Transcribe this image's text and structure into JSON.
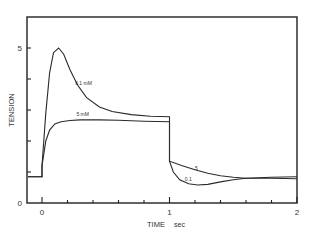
{
  "chart_data": {
    "type": "line",
    "title": "",
    "xlabel": "TIME",
    "xunit": "sec",
    "ylabel": "TENSION",
    "xlim": [
      -0.2,
      2.0
    ],
    "ylim": [
      0,
      6
    ],
    "x_ticks": [
      0,
      1,
      2
    ],
    "x_minor_step": 0.2,
    "y_ticks": [
      0,
      5
    ],
    "y_minor_step": 1,
    "grid": false,
    "legend": "inline labels",
    "annotations": [
      {
        "text": "0.1 mM",
        "x": 0.26,
        "y": 3.8
      },
      {
        "text": "5 mM",
        "x": 0.27,
        "y": 2.8
      },
      {
        "text": "5",
        "x": 1.2,
        "y": 1.05
      },
      {
        "text": "0.1",
        "x": 1.12,
        "y": 0.72
      }
    ],
    "series": [
      {
        "name": "0.1 mM",
        "x": [
          -0.2,
          0.0,
          0.0,
          0.03,
          0.06,
          0.09,
          0.13,
          0.17,
          0.22,
          0.28,
          0.35,
          0.45,
          0.55,
          0.7,
          0.85,
          1.0,
          1.0,
          1.03,
          1.08,
          1.15,
          1.22,
          1.3,
          1.4,
          1.5,
          1.6,
          1.8,
          2.0
        ],
        "y": [
          0.85,
          0.85,
          1.2,
          2.9,
          4.2,
          4.85,
          5.0,
          4.8,
          4.3,
          3.8,
          3.4,
          3.1,
          2.95,
          2.85,
          2.8,
          2.78,
          1.35,
          1.0,
          0.75,
          0.62,
          0.58,
          0.6,
          0.68,
          0.75,
          0.8,
          0.83,
          0.85
        ]
      },
      {
        "name": "5 mM",
        "x": [
          -0.2,
          0.0,
          0.0,
          0.03,
          0.06,
          0.1,
          0.15,
          0.22,
          0.3,
          0.45,
          0.6,
          0.8,
          1.0,
          1.0,
          1.1,
          1.2,
          1.3,
          1.4,
          1.5,
          1.6,
          1.8,
          2.0
        ],
        "y": [
          0.85,
          0.85,
          1.2,
          2.0,
          2.35,
          2.55,
          2.62,
          2.66,
          2.68,
          2.68,
          2.67,
          2.64,
          2.62,
          1.35,
          1.2,
          1.07,
          0.96,
          0.88,
          0.83,
          0.8,
          0.8,
          0.78
        ]
      }
    ]
  }
}
